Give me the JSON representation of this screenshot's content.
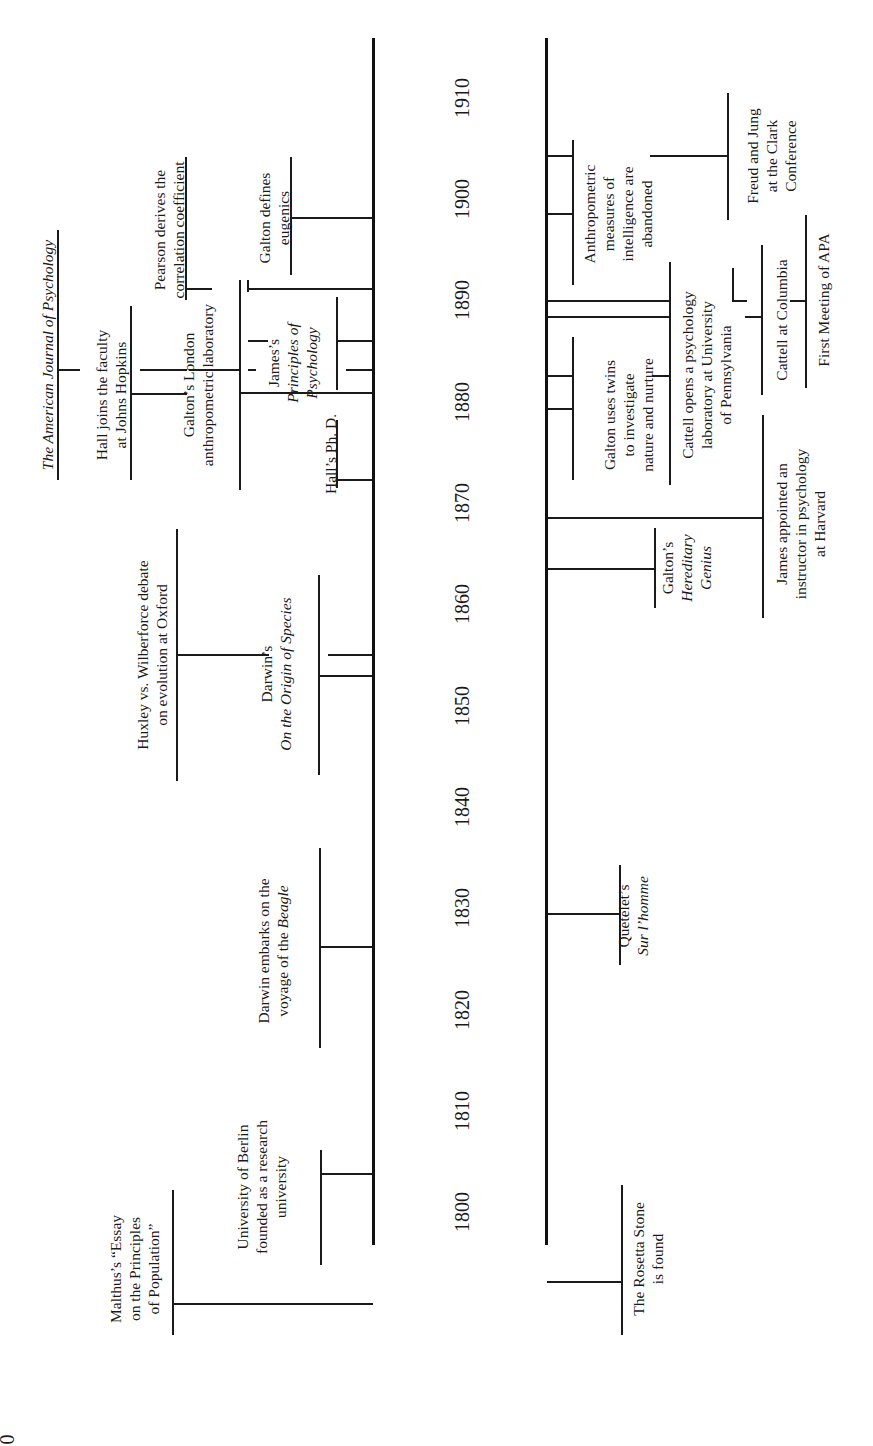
{
  "page_number_fragment": "0",
  "axis": {
    "years": [
      "1800",
      "1810",
      "1820",
      "1830",
      "1840",
      "1850",
      "1860",
      "1870",
      "1880",
      "1890",
      "1900",
      "1910"
    ]
  },
  "upper_events": [
    {
      "id": "malthus",
      "lines": [
        "Malthus’s “Essay",
        "on the Principles",
        "of Population”"
      ],
      "year": "1798"
    },
    {
      "id": "berlin",
      "lines": [
        "University of Berlin",
        "founded as a research",
        "university"
      ],
      "year": "1810"
    },
    {
      "id": "beagle",
      "lines": [
        "Darwin embarks on the",
        "voyage of the ",
        "Beagle"
      ],
      "year": "1831"
    },
    {
      "id": "huxley",
      "lines": [
        "Huxley vs. Wilberforce debate",
        "on evolution at Oxford"
      ],
      "year": "1860"
    },
    {
      "id": "origin",
      "lines": [
        "Darwin’s",
        "On the Origin of Species"
      ],
      "year": "1859"
    },
    {
      "id": "hallphd",
      "lines": [
        "Hall’s Ph. D."
      ],
      "year": "1878"
    },
    {
      "id": "ajp",
      "lines": [
        "The American Journal of Psychology"
      ],
      "year": "1887"
    },
    {
      "id": "hopkins",
      "lines": [
        "Hall joins the faculty",
        "at Johns Hopkins"
      ],
      "year": "1884"
    },
    {
      "id": "londonlab",
      "lines": [
        "Galton’s London",
        "anthropometric laboratory"
      ],
      "year": "1884"
    },
    {
      "id": "principles",
      "lines": [
        "James’s",
        "Principles of",
        "Psychology"
      ],
      "year": "1890"
    },
    {
      "id": "pearson",
      "lines": [
        "Pearson derives the",
        "correlation coefficient"
      ],
      "year": "1896"
    },
    {
      "id": "eugenics",
      "lines": [
        "Galton defines",
        "eugenics"
      ],
      "year": "1904"
    }
  ],
  "lower_events": [
    {
      "id": "rosetta",
      "lines": [
        "The Rosetta Stone",
        "is found"
      ],
      "year": "1799"
    },
    {
      "id": "quetelet",
      "lines": [
        "Quetelet’s",
        "Sur l’homme"
      ],
      "year": "1835"
    },
    {
      "id": "hereditary",
      "lines": [
        "Galton’s",
        "Hereditary",
        "Genius"
      ],
      "year": "1869"
    },
    {
      "id": "jamesharvard",
      "lines": [
        "James appointed an",
        "instructor in psychology",
        "at Harvard"
      ],
      "year": "1872"
    },
    {
      "id": "twins",
      "lines": [
        "Galton uses twins",
        "to investigate",
        "nature and nurture"
      ],
      "year": "1875"
    },
    {
      "id": "cattellpenn",
      "lines": [
        "Cattell opens a psychology",
        "laboratory at University",
        "of Pennsylvania"
      ],
      "year": "1888"
    },
    {
      "id": "columbia",
      "lines": [
        "Cattell at Columbia"
      ],
      "year": "1891"
    },
    {
      "id": "apa",
      "lines": [
        "First Meeting of APA"
      ],
      "year": "1892"
    },
    {
      "id": "anthropometric",
      "lines": [
        "Anthropometric",
        "measures of",
        "intelligence are",
        "abandoned"
      ],
      "year": "1901"
    },
    {
      "id": "freudjung",
      "lines": [
        "Freud and Jung",
        "at the Clark",
        "Conference"
      ],
      "year": "1909"
    }
  ]
}
